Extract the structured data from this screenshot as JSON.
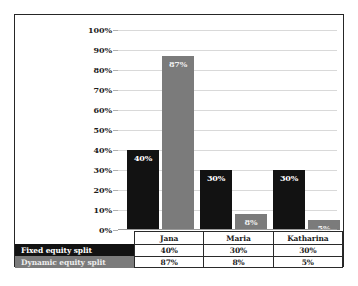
{
  "chart_data": {
    "type": "bar",
    "title": "",
    "subtitle": "",
    "xlabel": "",
    "ylabel": "",
    "categories": [
      "Jana",
      "Maria",
      "Katharina"
    ],
    "series": [
      {
        "name": "Fixed equity split",
        "values": [
          40,
          30,
          30
        ],
        "labels": [
          "40%",
          "30%",
          "30%"
        ],
        "color": "#121212"
      },
      {
        "name": "Dynamic equity split",
        "values": [
          87,
          8,
          5
        ],
        "labels": [
          "87%",
          "8%",
          "5%"
        ],
        "color": "#7b7b7b"
      }
    ],
    "ylim": [
      0,
      100
    ],
    "ytick_labels": [
      "100%",
      "90%",
      "80%",
      "70%",
      "60%",
      "50%",
      "40%",
      "30%",
      "20%",
      "10%",
      "0%"
    ],
    "ytick_values": [
      100,
      90,
      80,
      70,
      60,
      50,
      40,
      30,
      20,
      10,
      0
    ],
    "grid": true,
    "legend_position": "data-table-below",
    "data_table": {
      "header_blank": "",
      "columns": [
        "Jana",
        "Maria",
        "Katharina"
      ],
      "rows": [
        {
          "label": "Fixed equity split",
          "cells": [
            "40%",
            "30%",
            "30%"
          ]
        },
        {
          "label": "Dynamic equity split",
          "cells": [
            "87%",
            "8%",
            "5%"
          ]
        }
      ]
    }
  }
}
